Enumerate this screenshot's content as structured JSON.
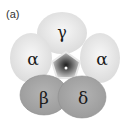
{
  "figure": {
    "panel_label": "(a)",
    "subunits": [
      {
        "id": "gamma",
        "label": "γ",
        "cx": 62,
        "cy": 33,
        "rx": 25,
        "ry": 21,
        "color": "#e6e6e6"
      },
      {
        "id": "alpha-left",
        "label": "α",
        "cx": 31,
        "cy": 58,
        "rx": 21,
        "ry": 25,
        "color": "#ebebeb"
      },
      {
        "id": "alpha-right",
        "label": "α",
        "cx": 100,
        "cy": 58,
        "rx": 20,
        "ry": 25,
        "color": "#ebebeb"
      },
      {
        "id": "beta",
        "label": "β",
        "cx": 44,
        "cy": 95,
        "rx": 24,
        "ry": 20,
        "color": "#a9a9a9"
      },
      {
        "id": "delta",
        "label": "δ",
        "cx": 82,
        "cy": 97,
        "rx": 24,
        "ry": 21,
        "color": "#a9a9a9"
      }
    ],
    "pore": {
      "cx": 66,
      "cy": 67,
      "color_outer": "#cfcfcf",
      "color_inner": "#3a3a3a",
      "center_dot": "#ffffff"
    }
  }
}
